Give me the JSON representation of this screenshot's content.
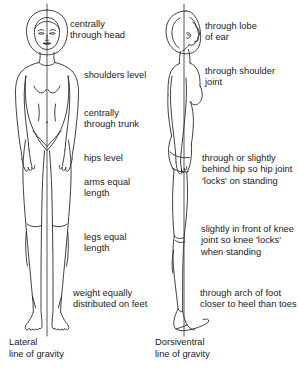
{
  "diagram": {
    "background_color": "#ffffff",
    "ink_color": "#2b2b2b",
    "text_color": "#1b1b1b",
    "gravity_line_color": "#3a3a3a"
  },
  "left_figure": {
    "name": "anterior-view-female-figure",
    "caption": "Lateral\nline of gravity",
    "annotations": [
      {
        "id": "head",
        "text": "centrally\nthrough head"
      },
      {
        "id": "shoulders",
        "text": "shoulders level"
      },
      {
        "id": "trunk",
        "text": "centrally\nthrough trunk"
      },
      {
        "id": "hips",
        "text": "hips level"
      },
      {
        "id": "arms",
        "text": "arms equal\nlength"
      },
      {
        "id": "legs",
        "text": "legs equal\nlength"
      },
      {
        "id": "feet",
        "text": "weight equally\ndistributed on feet"
      }
    ]
  },
  "right_figure": {
    "name": "lateral-view-female-figure",
    "caption": "Dorsiventral\nline of gravity",
    "annotations": [
      {
        "id": "ear",
        "text": "through lobe\nof ear"
      },
      {
        "id": "shoulder-joint",
        "text": "through shoulder\njoint"
      },
      {
        "id": "hip-joint",
        "text": "through or slightly\nbehind hip so hip joint\n'locks' on standing"
      },
      {
        "id": "knee-joint",
        "text": "slightly in front of knee\njoint so knee 'locks'\nwhen standing"
      },
      {
        "id": "foot-arch",
        "text": "through arch of foot\ncloser to heel than toes"
      }
    ]
  }
}
